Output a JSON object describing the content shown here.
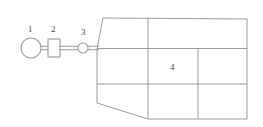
{
  "diagram": {
    "stroke_color": "#9a9a9a",
    "accent_color": "#8c8c8c",
    "background_color": "#ffffff",
    "label_color": "#4a4a4a",
    "nodes": [
      {
        "id": "1",
        "label": "1",
        "shape": "circle",
        "cx": 31,
        "cy": 48,
        "r": 10
      },
      {
        "id": "2",
        "label": "2",
        "shape": "rectangle",
        "x": 48,
        "y": 39,
        "width": 12,
        "height": 18
      },
      {
        "id": "3",
        "label": "3",
        "shape": "small-circle",
        "cx": 83,
        "cy": 48,
        "r": 5
      }
    ],
    "connectors": [
      {
        "from": "1",
        "to": "2",
        "style": "double-line"
      },
      {
        "from": "2",
        "to": "3",
        "style": "double-line"
      },
      {
        "from": "3",
        "to": "grid",
        "style": "double-line"
      }
    ],
    "grid": {
      "label": "4",
      "label_cell": "middle-center",
      "rows": 3,
      "outline": "irregular-polygon",
      "vertices": [
        {
          "x": 103,
          "y": 18
        },
        {
          "x": 247,
          "y": 19
        },
        {
          "x": 247,
          "y": 119
        },
        {
          "x": 148,
          "y": 119
        },
        {
          "x": 97,
          "y": 103
        },
        {
          "x": 97,
          "y": 49
        }
      ],
      "horizontal_dividers_y": [
        48,
        84
      ],
      "vertical_dividers": [
        {
          "x": 148,
          "from_y": 18,
          "to_y": 119
        },
        {
          "x": 198,
          "from_y": 48,
          "to_y": 119
        }
      ]
    }
  }
}
